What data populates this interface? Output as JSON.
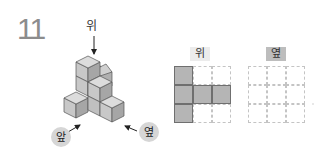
{
  "question": {
    "number": "11"
  },
  "figure": {
    "direction_labels": {
      "top": "위",
      "front": "앞",
      "side": "옆"
    }
  },
  "views": [
    {
      "title": "위",
      "grid_rows": 3,
      "grid_cols": 3,
      "filled": [
        [
          true,
          false,
          false
        ],
        [
          true,
          true,
          true
        ],
        [
          true,
          false,
          false
        ]
      ]
    },
    {
      "title": "옆",
      "grid_rows": 3,
      "grid_cols": 3,
      "filled": [
        [
          false,
          false,
          false
        ],
        [
          false,
          false,
          false
        ],
        [
          false,
          false,
          false
        ]
      ]
    }
  ],
  "colors": {
    "filled_cell": "#b5b5b5",
    "grid_dash": "#c4c4c4",
    "number": "#8c8c8c",
    "label_circle": "#d6d6d6",
    "side_title_bg": "#bdbdbd",
    "top_title_bg": "#ececec"
  }
}
